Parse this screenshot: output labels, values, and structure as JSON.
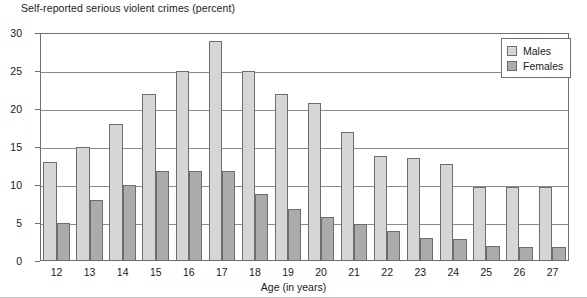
{
  "chart_data": {
    "type": "bar",
    "title": "Self-reported serious violent crimes (percent)",
    "xlabel": "Age (in years)",
    "ylabel": "",
    "ylim": [
      0,
      30
    ],
    "yticks": [
      0,
      5,
      10,
      15,
      20,
      25,
      30
    ],
    "grid": true,
    "legend_position": "top-right",
    "categories": [
      "12",
      "13",
      "14",
      "15",
      "16",
      "17",
      "18",
      "19",
      "20",
      "21",
      "22",
      "23",
      "24",
      "25",
      "26",
      "27"
    ],
    "series": [
      {
        "name": "Males",
        "color": "#d6d6d6",
        "values": [
          13,
          15,
          18,
          22,
          25,
          29,
          25,
          22,
          20.8,
          17,
          13.8,
          13.6,
          12.8,
          9.7,
          9.7,
          9.7
        ]
      },
      {
        "name": "Females",
        "color": "#ababab",
        "values": [
          5,
          8,
          10,
          11.8,
          11.8,
          11.8,
          8.8,
          6.8,
          5.8,
          4.9,
          4,
          3,
          2.9,
          2,
          1.9,
          1.9
        ]
      }
    ]
  },
  "legend": {
    "items": [
      {
        "label": "Males"
      },
      {
        "label": "Females"
      }
    ]
  }
}
